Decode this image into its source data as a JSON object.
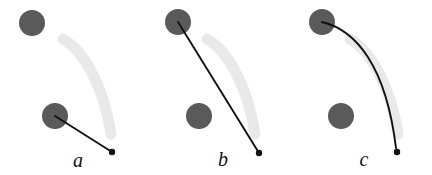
{
  "figure": {
    "width": 432,
    "height": 175,
    "background": "#ffffff",
    "colors": {
      "obstacle": "#5a5a5a",
      "reference_arc": "#e9e9e9",
      "path": "#111111",
      "endpoint_dot": "#111111",
      "label": "#111111"
    },
    "geometry": {
      "circle_radius": 13,
      "arc_stroke_width": 11,
      "path_stroke_width": 1.9,
      "endpoint_dot_radius": 3.2
    }
  },
  "panels": [
    {
      "id": "panel-a",
      "label": "a",
      "label_x": 78,
      "label_y": 167,
      "circles": [
        {
          "name": "upper-circle",
          "cx": 32,
          "cy": 23,
          "r": 13
        },
        {
          "name": "lower-circle",
          "cx": 55,
          "cy": 116,
          "r": 13
        }
      ],
      "reference_arc": "M 63 39 C 82 50 103 82 111 134",
      "path": "M 55 116 L 112 152",
      "path_type": "straight",
      "endpoint": {
        "x": 112,
        "y": 152
      }
    },
    {
      "id": "panel-b",
      "label": "b",
      "label_x": 223,
      "label_y": 166,
      "circles": [
        {
          "name": "upper-circle",
          "cx": 178,
          "cy": 22,
          "r": 13
        },
        {
          "name": "lower-circle",
          "cx": 199,
          "cy": 116,
          "r": 13
        }
      ],
      "reference_arc": "M 207 39 C 226 50 247 82 255 134",
      "path": "M 178 22 L 259 153",
      "path_type": "straight",
      "endpoint": {
        "x": 259,
        "y": 153
      }
    },
    {
      "id": "panel-c",
      "label": "c",
      "label_x": 364,
      "label_y": 166,
      "circles": [
        {
          "name": "upper-circle",
          "cx": 322,
          "cy": 22,
          "r": 13
        },
        {
          "name": "lower-circle",
          "cx": 341,
          "cy": 116,
          "r": 13
        }
      ],
      "reference_arc": "M 350 39 C 369 50 390 82 398 134",
      "path": "M 322 22 C 356 30 386 66 396 148",
      "path_type": "curved",
      "endpoint": {
        "x": 397,
        "y": 152
      }
    }
  ]
}
